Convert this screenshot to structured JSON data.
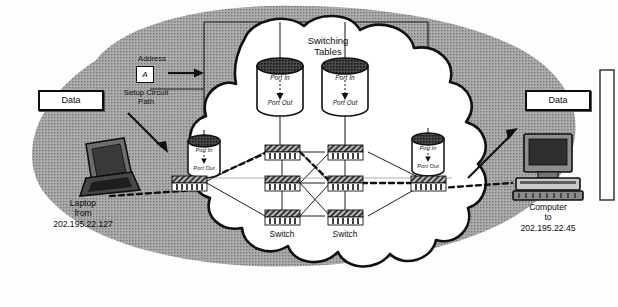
{
  "diagram": {
    "colors": {
      "cloud_fill": "#ffffff",
      "cloud_stroke": "#111111",
      "gray_region": "#9a9a9a",
      "switch_fill": "#2a2a2a",
      "text": "#111111",
      "line": "#222222"
    }
  },
  "left": {
    "data_box": "Data",
    "address_label": "Address",
    "address_value": "A",
    "setup_label_line1": "Setup Circuit",
    "setup_label_line2": "Path",
    "node_name": "Laptop",
    "node_preposition": "from",
    "node_ip": "202.195.22.127"
  },
  "right": {
    "data_box": "Data",
    "node_name": "Computer",
    "node_preposition": "to",
    "node_ip": "202.195.22.45"
  },
  "cloud": {
    "switching_tables_line1": "Switching",
    "switching_tables_line2": "Tables",
    "switch_label_left": "Switch",
    "switch_label_right": "Switch",
    "port_in": "Port In",
    "port_out": "Port Out"
  },
  "tables": [
    {
      "id": "table-left-edge",
      "port_in": "Port In",
      "port_out": "Port Out"
    },
    {
      "id": "table-center-1",
      "port_in": "Port In",
      "port_out": "Port Out"
    },
    {
      "id": "table-center-2",
      "port_in": "Port In",
      "port_out": "Port Out"
    },
    {
      "id": "table-right-edge",
      "port_in": "Port In",
      "port_out": "Port Out"
    }
  ],
  "switches": [
    {
      "id": "switch-r1c1"
    },
    {
      "id": "switch-r1c2"
    },
    {
      "id": "switch-r2c0"
    },
    {
      "id": "switch-r2c1"
    },
    {
      "id": "switch-r2c2"
    },
    {
      "id": "switch-r2c3"
    },
    {
      "id": "switch-r3c1"
    },
    {
      "id": "switch-r3c2"
    }
  ]
}
